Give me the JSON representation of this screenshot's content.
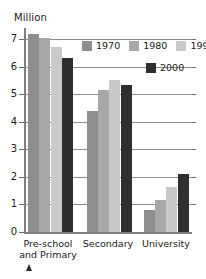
{
  "chart_data": {
    "type": "bar",
    "title": "",
    "subtitle": "",
    "xlabel": "",
    "ylabel": "Million",
    "ylim": [
      0,
      7.4
    ],
    "yticks": [
      0,
      1,
      2,
      3,
      4,
      5,
      6,
      7
    ],
    "ytick_labels": [
      "0",
      "1",
      "2",
      "3",
      "4",
      "5",
      "6",
      "7"
    ],
    "grid": true,
    "legend_position": "top-right",
    "categories": [
      "Pre-school and Primary",
      "Secondary",
      "University"
    ],
    "series": [
      {
        "name": "1970",
        "color": "#8e8e8e",
        "values": [
          7.2,
          4.4,
          0.8
        ]
      },
      {
        "name": "1980",
        "color": "#a8a8a8",
        "values": [
          7.05,
          5.15,
          1.15
        ]
      },
      {
        "name": "1990",
        "color": "#c9c9c9",
        "values": [
          6.7,
          5.5,
          1.65
        ]
      },
      {
        "name": "2000",
        "color": "#2f2f2f",
        "values": [
          6.3,
          5.35,
          2.1
        ]
      }
    ]
  },
  "axis": {
    "y_title": "Million",
    "tick_labels": [
      "7",
      "6",
      "5",
      "4",
      "3",
      "2",
      "1",
      "0"
    ]
  },
  "categories": [
    {
      "line1": "Pre-school",
      "line2": "and Primary"
    },
    {
      "line1": "Secondary",
      "line2": ""
    },
    {
      "line1": "University",
      "line2": ""
    }
  ],
  "legend": {
    "row1": [
      {
        "label": "1970",
        "color": "#8e8e8e"
      },
      {
        "label": "1980",
        "color": "#a8a8a8"
      },
      {
        "label": "1990",
        "color": "#c9c9c9"
      }
    ],
    "row2": [
      {
        "label": "2000",
        "color": "#2f2f2f"
      }
    ]
  },
  "marker": {
    "name": "up-arrow"
  }
}
